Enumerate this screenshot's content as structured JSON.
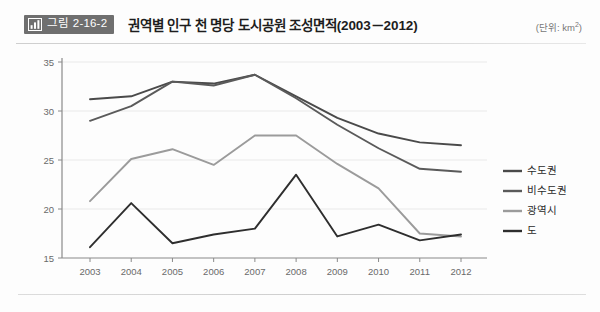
{
  "header": {
    "badge_icon": "bar-chart-icon",
    "badge_label": "그림 2-16-2",
    "title": "권역별 인구 천 명당 도시공원 조성면적(2003－2012)",
    "unit_prefix": "(단위: km",
    "unit_sup": "2",
    "unit_suffix": ")"
  },
  "colors": {
    "sudogwon": "#4a4a4a",
    "bisudogwon": "#5a5a5a",
    "gwangyeoksi": "#9b9b9b",
    "do": "#2e2e2e",
    "grid": "#e9e9e9",
    "axis": "#8a8a8a",
    "badge_bg": "#6f6f6f"
  },
  "chart_data": {
    "type": "line",
    "title": "권역별 인구 천 명당 도시공원 조성면적(2003－2012)",
    "xlabel": "",
    "ylabel": "",
    "unit": "km2",
    "categories": [
      "2003",
      "2004",
      "2005",
      "2006",
      "2007",
      "2008",
      "2009",
      "2010",
      "2011",
      "2012"
    ],
    "x": [
      2003,
      2004,
      2005,
      2006,
      2007,
      2008,
      2009,
      2010,
      2011,
      2012
    ],
    "ylim": [
      15,
      35
    ],
    "yticks": [
      15,
      20,
      25,
      30,
      35
    ],
    "grid": true,
    "legend_position": "right",
    "series": [
      {
        "name": "수도권",
        "color": "#4a4a4a",
        "values": [
          31.2,
          31.5,
          33.0,
          32.8,
          33.7,
          31.5,
          29.3,
          27.7,
          26.8,
          26.5
        ]
      },
      {
        "name": "비수도권",
        "color": "#5a5a5a",
        "values": [
          29.0,
          30.5,
          33.0,
          32.6,
          33.7,
          31.3,
          28.6,
          26.2,
          24.1,
          23.8
        ]
      },
      {
        "name": "광역시",
        "color": "#9b9b9b",
        "values": [
          20.8,
          25.1,
          26.1,
          24.5,
          27.5,
          27.5,
          24.6,
          22.1,
          17.5,
          17.2
        ]
      },
      {
        "name": "도",
        "color": "#2e2e2e",
        "values": [
          16.1,
          20.6,
          16.5,
          17.4,
          18.0,
          23.5,
          17.2,
          18.4,
          16.8,
          17.4
        ]
      }
    ]
  }
}
